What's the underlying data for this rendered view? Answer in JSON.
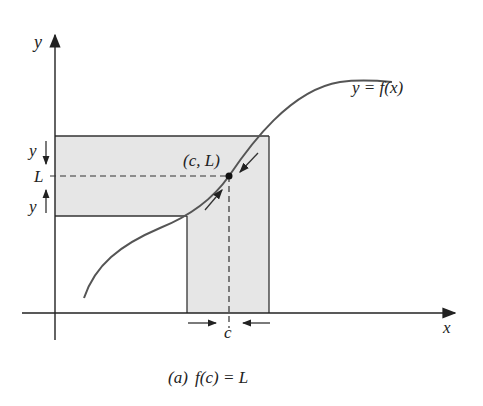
{
  "diagram": {
    "caption": {
      "label": "(a)",
      "text": "f(c) = L"
    },
    "axes": {
      "x_label": "x",
      "y_label": "y"
    },
    "curve_label": "y = f(x)",
    "point_label": "(c, L)",
    "y_value_label": "L",
    "x_value_label": "c",
    "y_arrow_labels": [
      "y",
      "y"
    ],
    "colors": {
      "shade": "#e6e6e6",
      "line": "#333333",
      "curve": "#555555"
    }
  }
}
